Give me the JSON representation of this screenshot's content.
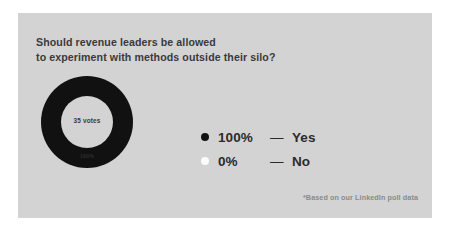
{
  "card": {
    "background_color": "#d3d3d3",
    "page_background_color": "#ffffff"
  },
  "poll": {
    "question": "Should revenue leaders be allowed\nto experiment with methods outside their silo?",
    "total_votes_label": "35 votes",
    "footnote": "*Based on our LinkedIn poll data"
  },
  "legend": {
    "rows": [
      {
        "dot_color": "#111111",
        "percent": "100%",
        "dash": "—",
        "label": "Yes"
      },
      {
        "dot_color": "#fbfbfb",
        "percent": "0%",
        "dash": "—",
        "label": "No"
      }
    ]
  },
  "chart_data": {
    "type": "pie",
    "variant": "donut",
    "title": "Should revenue leaders be allowed to experiment with methods outside their silo?",
    "categories": [
      "Yes",
      "No"
    ],
    "values": [
      100,
      0
    ],
    "value_unit": "percent",
    "slice_labels": [
      "100%",
      "0%"
    ],
    "slice_colors": [
      "#111111",
      "#fbfbfb"
    ],
    "center_label": "35 votes",
    "total_votes": 35,
    "on_chart_label": "100%",
    "legend_position": "right",
    "grid": false,
    "annotations": [
      "*Based on our LinkedIn poll data"
    ]
  }
}
